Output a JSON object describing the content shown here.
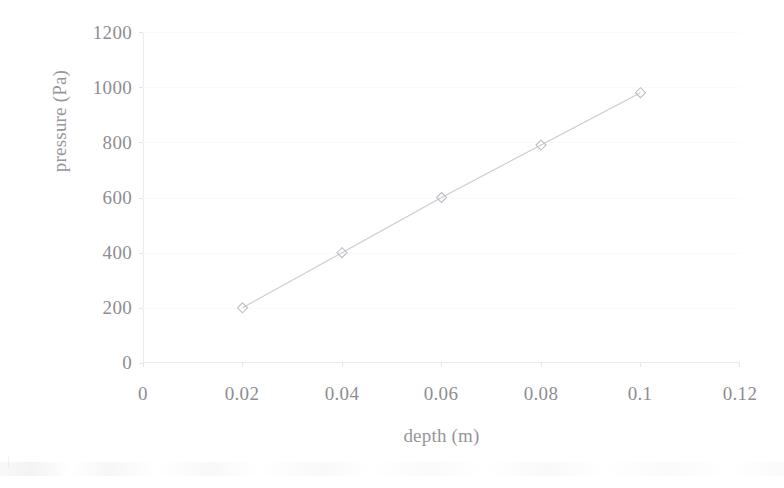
{
  "chart_data": {
    "type": "line",
    "title": "",
    "subtitle": "",
    "xlabel": "depth (m)",
    "ylabel": "pressure (Pa)",
    "x": [
      0.02,
      0.04,
      0.06,
      0.08,
      0.1
    ],
    "values": [
      200,
      400,
      600,
      790,
      980
    ],
    "series": [
      {
        "name": "pressure vs depth",
        "x": [
          0.02,
          0.04,
          0.06,
          0.08,
          0.1
        ],
        "values": [
          200,
          400,
          600,
          790,
          980
        ]
      }
    ],
    "xlim": [
      0,
      0.12
    ],
    "ylim": [
      0,
      1200
    ],
    "x_ticks": [
      "0",
      "0.02",
      "0.04",
      "0.06",
      "0.08",
      "0.1",
      "0.12"
    ],
    "x_tick_values": [
      0,
      0.02,
      0.04,
      0.06,
      0.08,
      0.1,
      0.12
    ],
    "y_ticks": [
      "0",
      "200",
      "400",
      "600",
      "800",
      "1000",
      "1200"
    ],
    "y_tick_values": [
      0,
      200,
      400,
      600,
      800,
      1000,
      1200
    ],
    "grid": true,
    "legend": false,
    "legend_position": "none",
    "marker": "diamond",
    "line_color": "#c9c9d0",
    "marker_color": "#bdbdc6",
    "axis_color": "#ececef",
    "text_color": "#8d8d93",
    "background": "#ffffff",
    "annotations": []
  },
  "axis": {
    "y_title": "pressure (Pa)",
    "x_title": "depth (m)"
  }
}
